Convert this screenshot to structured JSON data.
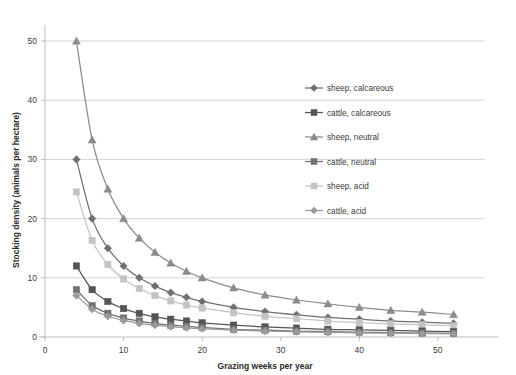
{
  "chart_data": {
    "type": "line",
    "title": "",
    "xlabel": "Grazing weeks per year",
    "ylabel": "Stocking density (animals per hectare)",
    "xlim": [
      0,
      56
    ],
    "ylim": [
      0,
      55
    ],
    "xticks": [
      0,
      10,
      20,
      30,
      40,
      50
    ],
    "yticks": [
      0,
      10,
      20,
      30,
      40,
      50
    ],
    "grid": "horizontal",
    "legend_position": "inside-right-upper",
    "x": [
      4,
      6,
      8,
      10,
      12,
      14,
      16,
      18,
      20,
      24,
      28,
      32,
      36,
      40,
      44,
      48,
      52
    ],
    "series": [
      {
        "name": "sheep, calcareous",
        "label": "sheep, calcareous",
        "marker": "diamond",
        "color": "#6f6f6f",
        "values": [
          30,
          20,
          15,
          12,
          10,
          8.6,
          7.5,
          6.7,
          6,
          5,
          4.3,
          3.75,
          3.3,
          3,
          2.7,
          2.5,
          2.3
        ]
      },
      {
        "name": "cattle, calcareous",
        "label": "cattle, calcareous",
        "marker": "square",
        "color": "#555555",
        "values": [
          12,
          8,
          6,
          4.8,
          4,
          3.4,
          3,
          2.7,
          2.4,
          2,
          1.7,
          1.5,
          1.3,
          1.2,
          1.1,
          1,
          0.9
        ]
      },
      {
        "name": "sheep, neutral",
        "label": "sheep, neutral",
        "marker": "triangle",
        "color": "#8b8b8b",
        "values": [
          50,
          33.3,
          25,
          20,
          16.7,
          14.3,
          12.5,
          11.1,
          10,
          8.3,
          7.1,
          6.25,
          5.6,
          5,
          4.5,
          4.2,
          3.8
        ]
      },
      {
        "name": "cattle, neutral",
        "label": "cattle, neutral",
        "marker": "square",
        "color": "#707070",
        "values": [
          8,
          5.3,
          4,
          3.2,
          2.7,
          2.3,
          2,
          1.8,
          1.6,
          1.3,
          1.15,
          1,
          0.9,
          0.8,
          0.73,
          0.67,
          0.6
        ]
      },
      {
        "name": "sheep, acid",
        "label": "sheep, acid",
        "marker": "square",
        "color": "#c4c4c4",
        "values": [
          24.5,
          16.3,
          12.25,
          9.8,
          8.2,
          7,
          6.1,
          5.4,
          4.9,
          4.1,
          3.5,
          3.1,
          2.7,
          2.45,
          2.2,
          2.05,
          1.9
        ]
      },
      {
        "name": "cattle, acid",
        "label": "cattle, acid",
        "marker": "diamond",
        "color": "#9a9a9a",
        "values": [
          7,
          4.7,
          3.5,
          2.8,
          2.3,
          2,
          1.75,
          1.55,
          1.4,
          1.17,
          1,
          0.88,
          0.78,
          0.7,
          0.64,
          0.58,
          0.54
        ]
      }
    ]
  },
  "axes": {
    "x_tick_labels": [
      "0",
      "10",
      "20",
      "30",
      "40",
      "50"
    ],
    "y_tick_labels": [
      "0",
      "10",
      "20",
      "30",
      "40",
      "50"
    ],
    "x_axis_title": "Grazing weeks per year",
    "y_axis_title": "Stocking density (animals per hectare)"
  },
  "legend": {
    "items": [
      {
        "label": "sheep, calcareous"
      },
      {
        "label": "cattle, calcareous"
      },
      {
        "label": "sheep, neutral"
      },
      {
        "label": "cattle, neutral"
      },
      {
        "label": "sheep, acid"
      },
      {
        "label": "cattle, acid"
      }
    ]
  }
}
